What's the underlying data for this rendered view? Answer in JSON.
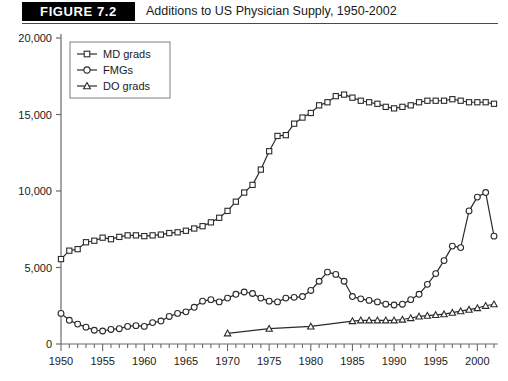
{
  "figure": {
    "badge": "FIGURE 7.2",
    "title": "Additions to US Physician Supply, 1950-2002"
  },
  "colors": {
    "ink": "#1a1a1a",
    "line": "#2b2b2b",
    "axis": "#6b6b6b",
    "badge_bg": "#000000",
    "badge_text": "#ffffff",
    "plot_bg": "#ffffff",
    "marker_fill": "#ffffff"
  },
  "legend": {
    "position": "top-left-inside",
    "entries": [
      {
        "label": "MD grads",
        "marker": "square"
      },
      {
        "label": "FMGs",
        "marker": "circle"
      },
      {
        "label": "DO grads",
        "marker": "triangle"
      }
    ]
  },
  "axes": {
    "x_tick_labels": [
      "1950",
      "1955",
      "1960",
      "1965",
      "1970",
      "1975",
      "1980",
      "1985",
      "1990",
      "1995",
      "2000"
    ],
    "y_tick_labels": [
      "0",
      "5,000",
      "10,000",
      "15,000",
      "20,000"
    ],
    "x_major_step": 5,
    "x_minor_step": 1,
    "grid": false
  },
  "chart_data": {
    "type": "line",
    "title": "Additions to US Physician Supply, 1950-2002",
    "xlabel": "",
    "ylabel": "",
    "xlim": [
      1950,
      2002
    ],
    "ylim": [
      0,
      20000
    ],
    "ytick_values": [
      0,
      5000,
      10000,
      15000,
      20000
    ],
    "xtick_values": [
      1950,
      1955,
      1960,
      1965,
      1970,
      1975,
      1980,
      1985,
      1990,
      1995,
      2000
    ],
    "series": [
      {
        "name": "MD grads",
        "marker": "square",
        "x": [
          1950,
          1951,
          1952,
          1953,
          1954,
          1955,
          1956,
          1957,
          1958,
          1959,
          1960,
          1961,
          1962,
          1963,
          1964,
          1965,
          1966,
          1967,
          1968,
          1969,
          1970,
          1971,
          1972,
          1973,
          1974,
          1975,
          1976,
          1977,
          1978,
          1979,
          1980,
          1981,
          1982,
          1983,
          1984,
          1985,
          1986,
          1987,
          1988,
          1989,
          1990,
          1991,
          1992,
          1993,
          1994,
          1995,
          1996,
          1997,
          1998,
          1999,
          2000,
          2001,
          2002
        ],
        "y": [
          5550,
          6100,
          6200,
          6650,
          6750,
          6950,
          6850,
          7000,
          7100,
          7100,
          7050,
          7100,
          7150,
          7250,
          7300,
          7400,
          7550,
          7700,
          7950,
          8250,
          8700,
          9300,
          9900,
          10400,
          11400,
          12600,
          13600,
          13650,
          14400,
          14800,
          15100,
          15600,
          15800,
          16200,
          16300,
          16100,
          15900,
          15800,
          15700,
          15500,
          15400,
          15500,
          15600,
          15800,
          15900,
          15900,
          15900,
          16000,
          15900,
          15800,
          15800,
          15800,
          15700
        ]
      },
      {
        "name": "FMGs",
        "marker": "circle",
        "x": [
          1950,
          1951,
          1952,
          1953,
          1954,
          1955,
          1956,
          1957,
          1958,
          1959,
          1960,
          1961,
          1962,
          1963,
          1964,
          1965,
          1966,
          1967,
          1968,
          1969,
          1970,
          1971,
          1972,
          1973,
          1974,
          1975,
          1976,
          1977,
          1978,
          1979,
          1980,
          1981,
          1982,
          1983,
          1984,
          1985,
          1986,
          1987,
          1988,
          1989,
          1990,
          1991,
          1992,
          1993,
          1994,
          1995,
          1996,
          1997,
          1998,
          1999,
          2000,
          2001,
          2002
        ],
        "y": [
          2000,
          1550,
          1300,
          1100,
          900,
          850,
          950,
          1000,
          1150,
          1200,
          1150,
          1400,
          1500,
          1800,
          2000,
          2100,
          2400,
          2800,
          2900,
          2750,
          3000,
          3250,
          3400,
          3300,
          3000,
          2800,
          2750,
          3000,
          3050,
          3100,
          3500,
          4100,
          4700,
          4550,
          4100,
          3100,
          2950,
          2850,
          2750,
          2600,
          2550,
          2600,
          2900,
          3250,
          3900,
          4600,
          5450,
          6400,
          6300,
          8700,
          9600,
          9900,
          7050
        ]
      },
      {
        "name": "DO grads",
        "marker": "triangle",
        "x": [
          1970,
          1975,
          1980,
          1985,
          1986,
          1987,
          1988,
          1989,
          1990,
          1991,
          1992,
          1993,
          1994,
          1995,
          1996,
          1997,
          1998,
          1999,
          2000,
          2001,
          2002
        ],
        "y": [
          700,
          1000,
          1150,
          1500,
          1550,
          1550,
          1550,
          1550,
          1550,
          1600,
          1700,
          1800,
          1850,
          1900,
          1950,
          2050,
          2150,
          2250,
          2350,
          2500,
          2600
        ]
      }
    ]
  }
}
